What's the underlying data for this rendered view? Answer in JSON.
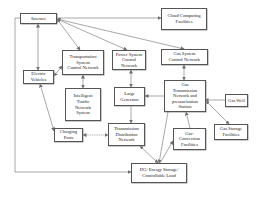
{
  "diagram": {
    "nodes": {
      "internet": "Internet",
      "cloud": "Cloud Computing\nFacilities",
      "transport_ctrl": "Transportation\nSystem\nControl Network",
      "power_ctrl": "Power System\nControl\nNetwork",
      "gas_ctrl": "Gas System\nControl Network",
      "ev": "Electric\nVehicles",
      "its": "Intelligent\nTraffic\nNetwork\nSystem",
      "generator": "Large\nGenerator",
      "gas_trans": "Gas\nTransmission\nNetwork and\npressurization\nStation",
      "gas_well": "Gas Well",
      "gas_storage": "Gas Storage\nFacilities",
      "charging": "Charging\nPosts",
      "tdn": "Transmission\nDistribution\nNetwork",
      "gas_conv": "Gas-\nConversion\nFacilities",
      "dg": "DG/ Energy Storage/\nControllable Load"
    },
    "edges": [
      {
        "from": "internet",
        "to": "cloud",
        "direction": "forward"
      },
      {
        "from": "internet",
        "to": "transport_ctrl",
        "direction": "both"
      },
      {
        "from": "internet",
        "to": "power_ctrl",
        "direction": "both"
      },
      {
        "from": "internet",
        "to": "gas_ctrl",
        "direction": "both"
      },
      {
        "from": "internet",
        "to": "ev",
        "direction": "both"
      },
      {
        "from": "internet",
        "to": "dg",
        "direction": "forward",
        "routing": "left-loop"
      },
      {
        "from": "ev",
        "to": "transport_ctrl",
        "direction": "both"
      },
      {
        "from": "ev",
        "to": "charging",
        "direction": "both"
      },
      {
        "from": "transport_ctrl",
        "to": "its",
        "direction": "both"
      },
      {
        "from": "power_ctrl",
        "to": "generator",
        "direction": "both"
      },
      {
        "from": "generator",
        "to": "tdn",
        "direction": "forward"
      },
      {
        "from": "gas_trans",
        "to": "generator",
        "direction": "forward"
      },
      {
        "from": "gas_ctrl",
        "to": "gas_trans",
        "direction": "both"
      },
      {
        "from": "gas_well",
        "to": "gas_trans",
        "direction": "forward"
      },
      {
        "from": "gas_trans",
        "to": "gas_storage",
        "direction": "both"
      },
      {
        "from": "gas_conv",
        "to": "gas_trans",
        "direction": "forward"
      },
      {
        "from": "charging",
        "to": "tdn",
        "direction": "both",
        "style": "dotted"
      },
      {
        "from": "tdn",
        "to": "dg",
        "direction": "both"
      },
      {
        "from": "dg",
        "to": "gas_conv",
        "direction": "forward"
      },
      {
        "from": "gas_trans",
        "to": "dg",
        "direction": "forward"
      }
    ]
  }
}
